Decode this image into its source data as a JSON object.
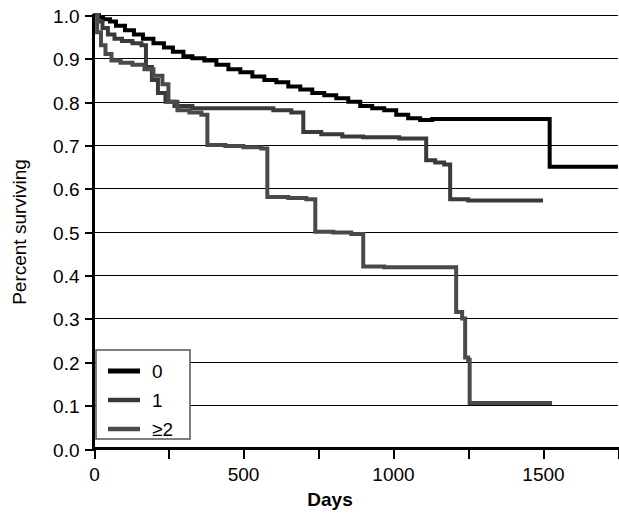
{
  "chart_data": {
    "type": "line",
    "subtype": "kaplan-meier-step",
    "title": "",
    "xlabel": "Days",
    "ylabel": "Percent surviving",
    "xlim": [
      0,
      1750
    ],
    "ylim": [
      0.0,
      1.0
    ],
    "xticks": [
      0,
      250,
      500,
      750,
      1000,
      1250,
      1500,
      1750
    ],
    "xtick_labels": [
      "0",
      "",
      "500",
      "",
      "1000",
      "",
      "1500",
      ""
    ],
    "yticks": [
      0.0,
      0.1,
      0.2,
      0.3,
      0.4,
      0.5,
      0.6,
      0.7,
      0.8,
      0.9,
      1.0
    ],
    "ytick_labels": [
      "0.0",
      "0.1",
      "0.2",
      "0.3",
      "0.4",
      "0.5",
      "0.6",
      "0.7",
      "0.8",
      "0.9",
      "1.0"
    ],
    "grid": "horizontal",
    "legend_position": "lower-left",
    "series": [
      {
        "name": "0",
        "color": "#000000",
        "width": 4,
        "points": [
          [
            0,
            1.0
          ],
          [
            18,
            0.995
          ],
          [
            32,
            0.99
          ],
          [
            55,
            0.985
          ],
          [
            75,
            0.975
          ],
          [
            105,
            0.965
          ],
          [
            135,
            0.955
          ],
          [
            165,
            0.945
          ],
          [
            200,
            0.935
          ],
          [
            235,
            0.925
          ],
          [
            265,
            0.915
          ],
          [
            300,
            0.905
          ],
          [
            330,
            0.9
          ],
          [
            370,
            0.895
          ],
          [
            410,
            0.885
          ],
          [
            450,
            0.875
          ],
          [
            490,
            0.868
          ],
          [
            530,
            0.858
          ],
          [
            570,
            0.85
          ],
          [
            610,
            0.845
          ],
          [
            650,
            0.835
          ],
          [
            690,
            0.828
          ],
          [
            730,
            0.82
          ],
          [
            770,
            0.815
          ],
          [
            810,
            0.808
          ],
          [
            850,
            0.8
          ],
          [
            890,
            0.79
          ],
          [
            930,
            0.785
          ],
          [
            970,
            0.78
          ],
          [
            1010,
            0.77
          ],
          [
            1050,
            0.762
          ],
          [
            1090,
            0.758
          ],
          [
            1130,
            0.76
          ],
          [
            1180,
            0.76
          ],
          [
            1250,
            0.76
          ],
          [
            1350,
            0.76
          ],
          [
            1450,
            0.76
          ],
          [
            1520,
            0.76
          ],
          [
            1522,
            0.65
          ],
          [
            1750,
            0.65
          ]
        ]
      },
      {
        "name": "1",
        "color": "#3a3a3a",
        "width": 4,
        "points": [
          [
            0,
            1.0
          ],
          [
            15,
            0.985
          ],
          [
            30,
            0.97
          ],
          [
            48,
            0.955
          ],
          [
            70,
            0.945
          ],
          [
            95,
            0.94
          ],
          [
            130,
            0.935
          ],
          [
            160,
            0.93
          ],
          [
            175,
            0.88
          ],
          [
            195,
            0.85
          ],
          [
            215,
            0.82
          ],
          [
            240,
            0.8
          ],
          [
            270,
            0.79
          ],
          [
            330,
            0.785
          ],
          [
            400,
            0.785
          ],
          [
            470,
            0.785
          ],
          [
            540,
            0.785
          ],
          [
            600,
            0.78
          ],
          [
            660,
            0.775
          ],
          [
            700,
            0.73
          ],
          [
            760,
            0.725
          ],
          [
            830,
            0.72
          ],
          [
            900,
            0.718
          ],
          [
            960,
            0.718
          ],
          [
            1020,
            0.715
          ],
          [
            1080,
            0.715
          ],
          [
            1110,
            0.665
          ],
          [
            1140,
            0.66
          ],
          [
            1170,
            0.655
          ],
          [
            1190,
            0.575
          ],
          [
            1250,
            0.572
          ],
          [
            1330,
            0.572
          ],
          [
            1420,
            0.572
          ],
          [
            1500,
            0.572
          ]
        ]
      },
      {
        "name": "≥2",
        "color": "#4a4a4a",
        "width": 4,
        "points": [
          [
            0,
            1.0
          ],
          [
            12,
            0.96
          ],
          [
            25,
            0.93
          ],
          [
            40,
            0.91
          ],
          [
            60,
            0.895
          ],
          [
            90,
            0.89
          ],
          [
            130,
            0.885
          ],
          [
            170,
            0.875
          ],
          [
            200,
            0.86
          ],
          [
            230,
            0.84
          ],
          [
            250,
            0.8
          ],
          [
            280,
            0.78
          ],
          [
            320,
            0.775
          ],
          [
            360,
            0.77
          ],
          [
            380,
            0.7
          ],
          [
            440,
            0.698
          ],
          [
            500,
            0.695
          ],
          [
            560,
            0.692
          ],
          [
            580,
            0.58
          ],
          [
            650,
            0.578
          ],
          [
            710,
            0.575
          ],
          [
            740,
            0.5
          ],
          [
            800,
            0.498
          ],
          [
            860,
            0.495
          ],
          [
            900,
            0.42
          ],
          [
            970,
            0.418
          ],
          [
            1040,
            0.418
          ],
          [
            1110,
            0.418
          ],
          [
            1180,
            0.418
          ],
          [
            1210,
            0.315
          ],
          [
            1230,
            0.3
          ],
          [
            1240,
            0.21
          ],
          [
            1250,
            0.205
          ],
          [
            1255,
            0.105
          ],
          [
            1320,
            0.105
          ],
          [
            1400,
            0.105
          ],
          [
            1480,
            0.105
          ],
          [
            1530,
            0.105
          ]
        ]
      }
    ],
    "legend": {
      "entries": [
        {
          "label": "0",
          "color": "#000000",
          "width": 5
        },
        {
          "label": "1",
          "color": "#3a3a3a",
          "width": 4.5
        },
        {
          "label": "≥2",
          "color": "#4a4a4a",
          "width": 4.5
        }
      ]
    }
  },
  "axes": {
    "y_title": "Percent surviving",
    "x_title": "Days"
  }
}
